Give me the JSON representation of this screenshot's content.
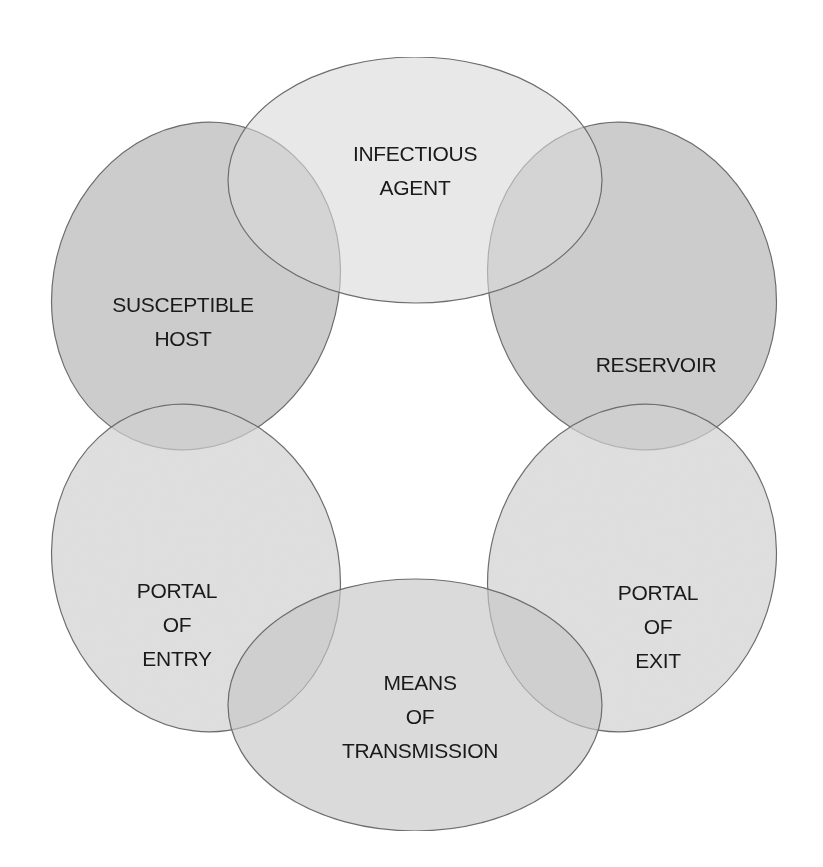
{
  "diagram": {
    "type": "chain-of-infection",
    "colors": {
      "stroke": "#6e6e6e",
      "light_fill": "#dcdcdc",
      "medium_fill": "#c6c6c6",
      "dark_fill": "#b8b8b8",
      "text": "#1a1a1a",
      "background": "#ffffff"
    },
    "nodes": [
      {
        "id": "infectious-agent",
        "lines": [
          "INFECTIOUS",
          "AGENT"
        ],
        "position": "top"
      },
      {
        "id": "reservoir",
        "lines": [
          "RESERVOIR"
        ],
        "position": "upper-right"
      },
      {
        "id": "portal-of-exit",
        "lines": [
          "PORTAL",
          "OF",
          "EXIT"
        ],
        "position": "lower-right"
      },
      {
        "id": "means-of-transmission",
        "lines": [
          "MEANS",
          "OF",
          "TRANSMISSION"
        ],
        "position": "bottom"
      },
      {
        "id": "portal-of-entry",
        "lines": [
          "PORTAL",
          "OF",
          "ENTRY"
        ],
        "position": "lower-left"
      },
      {
        "id": "susceptible-host",
        "lines": [
          "SUSCEPTIBLE",
          "HOST"
        ],
        "position": "upper-left"
      }
    ],
    "links": [
      [
        "infectious-agent",
        "reservoir"
      ],
      [
        "reservoir",
        "portal-of-exit"
      ],
      [
        "portal-of-exit",
        "means-of-transmission"
      ],
      [
        "means-of-transmission",
        "portal-of-entry"
      ],
      [
        "portal-of-entry",
        "susceptible-host"
      ],
      [
        "susceptible-host",
        "infectious-agent"
      ]
    ]
  }
}
